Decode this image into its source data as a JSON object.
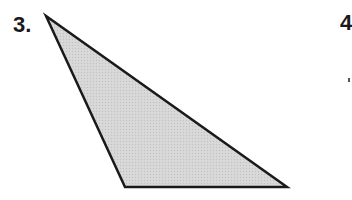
{
  "problems": [
    {
      "label": "3.",
      "figure": {
        "type": "triangle",
        "vertices": [
          [
            46,
            16
          ],
          [
            125,
            187
          ],
          [
            287,
            187
          ]
        ],
        "fill": "#d4d4d4",
        "stroke": "#1a1a1a",
        "stroke_width": 2.5
      }
    },
    {
      "label": "4"
    }
  ]
}
